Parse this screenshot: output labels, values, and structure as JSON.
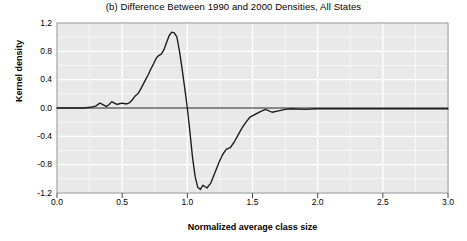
{
  "chart_data": {
    "type": "line",
    "title": "(b) Difference Between 1990 and 2000 Densities, All States",
    "xlabel": "Normalized average class size",
    "ylabel": "Kernel density",
    "xlim": [
      0.0,
      3.0
    ],
    "ylim": [
      -1.2,
      1.2
    ],
    "xticks": [
      "0.0",
      "0.5",
      "1.0",
      "1.5",
      "2.0",
      "2.5",
      "3.0"
    ],
    "xtick_values": [
      0.0,
      0.5,
      1.0,
      1.5,
      2.0,
      2.5,
      3.0
    ],
    "yticks": [
      "1.2",
      "0.8",
      "0.4",
      "0.0",
      "-0.4",
      "-0.8",
      "-1.2"
    ],
    "ytick_values": [
      1.2,
      0.8,
      0.4,
      0.0,
      -0.4,
      -0.8,
      -1.2
    ],
    "grid": true,
    "legend": false,
    "plot_bg_color": "#e9e9e9",
    "grid_color": "#ffffff",
    "line_color": "#1a1a1a",
    "zero_reference_line": 0.0,
    "series": [
      {
        "name": "Difference 1990-2000",
        "x": [
          0.0,
          0.1,
          0.2,
          0.26,
          0.3,
          0.33,
          0.36,
          0.38,
          0.4,
          0.42,
          0.44,
          0.46,
          0.48,
          0.5,
          0.52,
          0.54,
          0.56,
          0.58,
          0.6,
          0.62,
          0.64,
          0.66,
          0.68,
          0.7,
          0.72,
          0.74,
          0.76,
          0.78,
          0.8,
          0.82,
          0.84,
          0.86,
          0.88,
          0.9,
          0.92,
          0.94,
          0.96,
          0.98,
          1.0,
          1.02,
          1.04,
          1.06,
          1.08,
          1.1,
          1.12,
          1.15,
          1.18,
          1.21,
          1.24,
          1.27,
          1.3,
          1.33,
          1.36,
          1.39,
          1.42,
          1.45,
          1.48,
          1.52,
          1.56,
          1.6,
          1.65,
          1.7,
          1.75,
          1.8,
          1.9,
          2.0,
          2.2,
          2.5,
          2.75,
          3.0
        ],
        "y": [
          0.0,
          0.0,
          0.0,
          0.01,
          0.03,
          0.07,
          0.04,
          0.02,
          0.05,
          0.09,
          0.07,
          0.05,
          0.06,
          0.07,
          0.06,
          0.06,
          0.08,
          0.12,
          0.17,
          0.2,
          0.26,
          0.33,
          0.4,
          0.47,
          0.55,
          0.62,
          0.7,
          0.74,
          0.76,
          0.82,
          0.92,
          1.02,
          1.07,
          1.06,
          1.0,
          0.8,
          0.55,
          0.28,
          0.0,
          -0.34,
          -0.7,
          -0.97,
          -1.12,
          -1.15,
          -1.09,
          -1.13,
          -1.06,
          -0.92,
          -0.78,
          -0.66,
          -0.58,
          -0.56,
          -0.48,
          -0.38,
          -0.28,
          -0.2,
          -0.13,
          -0.09,
          -0.05,
          -0.02,
          -0.06,
          -0.04,
          -0.02,
          -0.01,
          -0.02,
          -0.01,
          -0.01,
          -0.01,
          -0.01,
          -0.01
        ]
      }
    ]
  }
}
